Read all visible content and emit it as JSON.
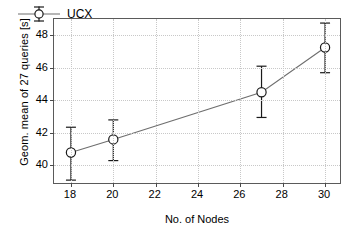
{
  "chart_data": {
    "type": "line",
    "title": "",
    "xlabel": "No. of Nodes",
    "ylabel": "Geom. mean of 27 queries [s]",
    "xlim": [
      17.2,
      30.8
    ],
    "ylim": [
      38.8,
      49.0
    ],
    "xticks": [
      18,
      20,
      22,
      24,
      26,
      28,
      30
    ],
    "yticks": [
      40,
      42,
      44,
      46,
      48
    ],
    "grid": true,
    "legend_position": "top-left",
    "series": [
      {
        "name": "UCX",
        "marker": "open-circle",
        "line_color": "#6e6e6e",
        "marker_color": "#1a1a1a",
        "errorbar_color": "#1a1a1a",
        "x": [
          18,
          20,
          27,
          30
        ],
        "values": [
          40.8,
          41.6,
          44.5,
          47.25
        ],
        "err_low": [
          39.1,
          40.3,
          42.95,
          45.7
        ],
        "err_high": [
          42.35,
          42.8,
          46.1,
          48.75
        ]
      }
    ]
  },
  "legend": {
    "entries": [
      {
        "label": "UCX"
      }
    ]
  },
  "axes": {
    "x_tick_labels": [
      "18",
      "20",
      "22",
      "24",
      "26",
      "28",
      "30"
    ],
    "y_tick_labels": [
      "40",
      "42",
      "44",
      "46",
      "48"
    ],
    "x_title": "No. of Nodes",
    "y_title": "Geom. mean of 27 queries [s]"
  },
  "colors": {
    "frame": "#5a5a5a",
    "grid": "#c8c8c8",
    "line": "#6e6e6e",
    "marker": "#1a1a1a",
    "background": "#ffffff"
  }
}
